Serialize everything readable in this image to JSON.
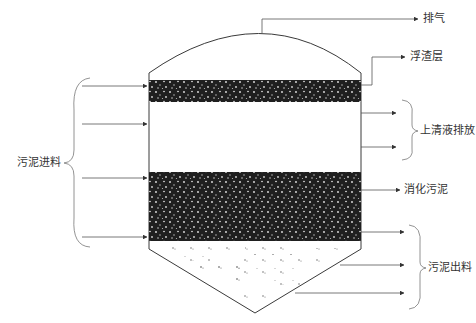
{
  "diagram": {
    "type": "anaerobic-digester-cross-section",
    "layers": [
      {
        "name": "scum-layer",
        "label": "浮渣层",
        "fill": "#1f1f1f"
      },
      {
        "name": "supernatant-layer",
        "fill": "#ffffff"
      },
      {
        "name": "digested-sludge-layer",
        "label": "消化污泥",
        "fill": "#1f1f1f"
      },
      {
        "name": "cone-sludge-zone",
        "fill": "#ffffff"
      }
    ],
    "labels": {
      "gas_outlet": "排气",
      "scum": "浮渣层",
      "supernatant_discharge": "上清液排放",
      "digested_sludge": "消化污泥",
      "sludge_feed": "污泥进料",
      "sludge_discharge": "污泥出料"
    },
    "inlet_arrows": 4,
    "supernatant_arrows": 2,
    "discharge_arrows": 3,
    "colors": {
      "line": "#3a3a3a",
      "dark_layer": "#1f1f1f",
      "speckle": "#e8e8e8",
      "text": "#333333"
    }
  }
}
